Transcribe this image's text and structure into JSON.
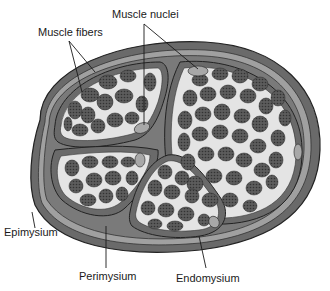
{
  "labels": {
    "muscle_fibers": "Muscle fibers",
    "muscle_nuclei": "Muscle nuclei",
    "epimysium": "Epimysium",
    "perimysium": "Perimysium",
    "endomysium": "Endomysium"
  },
  "colors": {
    "epimysium": "#6e6e6e",
    "epimysium_light": "#9a9a9a",
    "perimysium": "#7a7a7a",
    "endomysium": "#e6e6e6",
    "fiber": "#5a5a5a",
    "fiber_dot": "#3a3a3a",
    "nucleus": "#a8a8a8",
    "outline": "#2a2a2a"
  },
  "fascicles": [
    {
      "name": "fascicle-top-left"
    },
    {
      "name": "fascicle-right"
    },
    {
      "name": "fascicle-bottom-left"
    },
    {
      "name": "fascicle-bottom-middle"
    }
  ]
}
